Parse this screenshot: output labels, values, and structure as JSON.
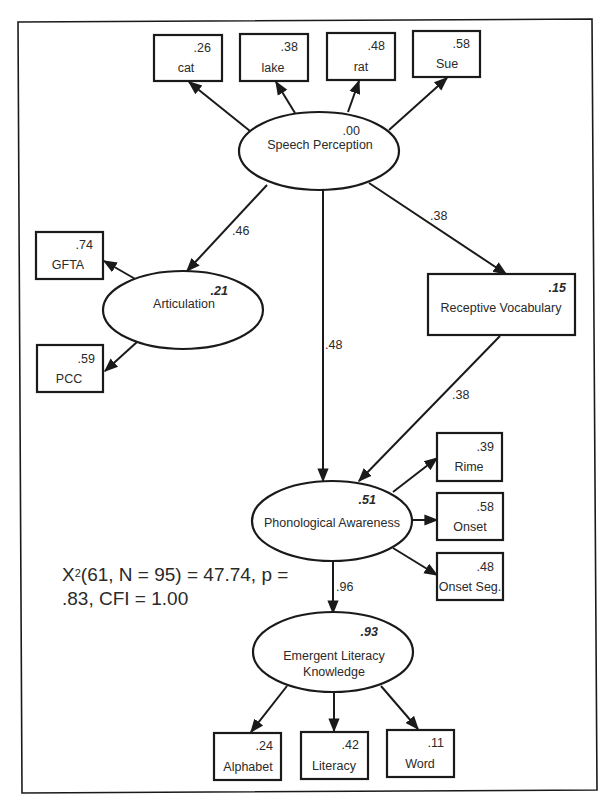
{
  "figure": {
    "type": "structural-equation-model",
    "fit_statistics": {
      "chi_symbol": "X",
      "chi_superscript": "2",
      "line1_rest": "(61, N = 95) = 47.74, p =",
      "line2": ".83, CFI = 1.00"
    }
  },
  "latent": {
    "speech_perception": {
      "label": "Speech Perception",
      "r2": ".00"
    },
    "articulation": {
      "label": "Articulation",
      "r2": ".21"
    },
    "phonological_awareness": {
      "label": "Phonological Awareness",
      "r2": ".51"
    },
    "emergent_literacy": {
      "label_line1": "Emergent Literacy",
      "label_line2": "Knowledge",
      "r2": ".93"
    }
  },
  "observed": {
    "receptive_vocabulary": {
      "label": "Receptive Vocabulary",
      "r2": ".15"
    },
    "cat": {
      "label": "cat",
      "value": ".26"
    },
    "lake": {
      "label": "lake",
      "value": ".38"
    },
    "rat": {
      "label": "rat",
      "value": ".48"
    },
    "sue": {
      "label": "Sue",
      "value": ".58"
    },
    "gfta": {
      "label": "GFTA",
      "value": ".74"
    },
    "pcc": {
      "label": "PCC",
      "value": ".59"
    },
    "rime": {
      "label": "Rime",
      "value": ".39"
    },
    "onset": {
      "label": "Onset",
      "value": ".58"
    },
    "onset_seg": {
      "label": "Onset Seg.",
      "value": ".48"
    },
    "alphabet": {
      "label": "Alphabet",
      "value": ".24"
    },
    "literacy": {
      "label": "Literacy",
      "value": ".42"
    },
    "word": {
      "label": "Word",
      "value": ".11"
    }
  },
  "paths": {
    "sp_to_articulation": ".46",
    "sp_to_phonological": ".48",
    "sp_to_vocabulary": ".38",
    "vocabulary_to_phonological": ".38",
    "phonological_to_literacy": ".96"
  },
  "colors": {
    "stroke": "#1a1a1a",
    "text": "#2a2a2a",
    "background": "#ffffff"
  }
}
